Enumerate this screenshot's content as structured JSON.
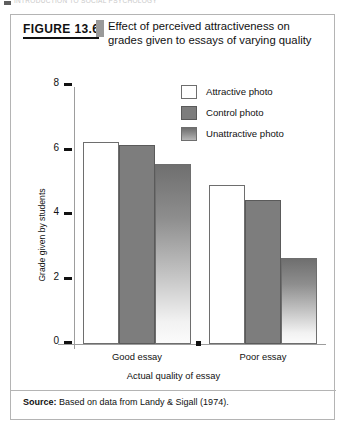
{
  "running_header": {
    "text": "INTRODUCTION TO SOCIAL PSYCHOLOGY"
  },
  "figure": {
    "number_label": "FIGURE 13.6",
    "title": "Effect of perceived attractiveness on grades given to essays of varying quality",
    "source_prefix": "Source:",
    "source_text": "Based on data from Landy & Sigall (1974)."
  },
  "legend": {
    "items": [
      {
        "label": "Attractive photo",
        "swatch": "attractive",
        "color": "#ffffff"
      },
      {
        "label": "Control photo",
        "swatch": "control",
        "color": "#7d7d7d"
      },
      {
        "label": "Unattractive photo",
        "swatch": "unattractive",
        "color": "#8e8e8e"
      }
    ]
  },
  "chart_data": {
    "type": "bar",
    "title": "Effect of perceived attractiveness on grades given to essays of varying quality",
    "xlabel": "Actual quality of essay",
    "ylabel": "Grade given by students",
    "categories": [
      "Good essay",
      "Poor essay"
    ],
    "series": [
      {
        "name": "Attractive photo",
        "values": [
          6.6,
          5.2
        ]
      },
      {
        "name": "Control photo",
        "values": [
          6.5,
          4.7
        ]
      },
      {
        "name": "Unattractive photo",
        "values": [
          5.9,
          2.8
        ]
      }
    ],
    "ylim": [
      0,
      8.4
    ],
    "yticks": [
      0,
      2,
      4,
      6,
      8
    ],
    "ytick_labels": [
      "0",
      "2",
      "4",
      "6",
      "8"
    ],
    "grid": false,
    "legend_position": "upper right"
  }
}
